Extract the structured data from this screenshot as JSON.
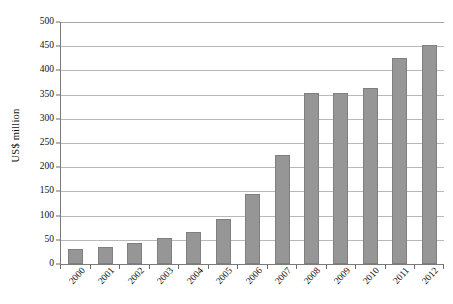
{
  "chart_data": {
    "type": "bar",
    "title": "",
    "subtitle": "",
    "xlabel": "",
    "ylabel": "US$ million",
    "categories": [
      "2000",
      "2001",
      "2002",
      "2003",
      "2004",
      "2005",
      "2006",
      "2007",
      "2008",
      "2009",
      "2010",
      "2011",
      "2012"
    ],
    "values": [
      31,
      35,
      44,
      54,
      66,
      92,
      145,
      225,
      353,
      353,
      363,
      425,
      452
    ],
    "ylim": [
      0,
      500
    ],
    "ytick_step": 50,
    "yticks": [
      0,
      50,
      100,
      150,
      200,
      250,
      300,
      350,
      400,
      450,
      500
    ],
    "ytick_labels": [
      "0",
      "50",
      "100",
      "150",
      "200",
      "250",
      "300",
      "350",
      "400",
      "450",
      "500"
    ],
    "grid": true,
    "grid_axis": "y",
    "legend": false,
    "legend_position": "none",
    "bar_color": "#969696",
    "bar_border_color": "#7f7f7f",
    "gridline_color": "#b9b9b9",
    "axis_color": "#7a7a7a",
    "xtick_label_rotation": -48,
    "annotations": []
  }
}
